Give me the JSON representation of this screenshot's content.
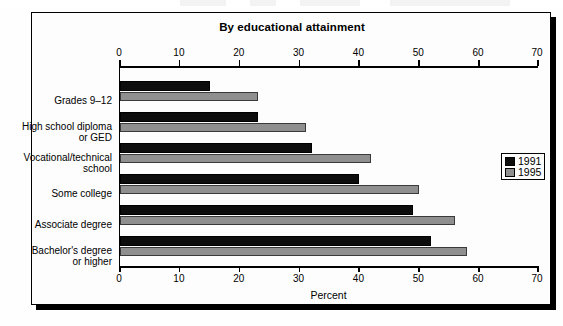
{
  "chart_data": {
    "type": "bar",
    "orientation": "horizontal",
    "title": "By educational attainment",
    "xlabel": "Percent",
    "ylabel": "",
    "xlim": [
      0,
      70
    ],
    "xticks": [
      0,
      10,
      20,
      30,
      40,
      50,
      60,
      70
    ],
    "grid": false,
    "legend_position": "right-middle",
    "categories": [
      "Grades 9–12",
      "High school diploma or GED",
      "Vocational/technical school",
      "Some college",
      "Associate degree",
      "Bachelor's degree or higher"
    ],
    "category_lines": [
      [
        "Grades 9–12"
      ],
      [
        "High school diploma",
        "or GED"
      ],
      [
        "Vocational/technical",
        "school"
      ],
      [
        "Some college"
      ],
      [
        "Associate degree"
      ],
      [
        "Bachelor's degree",
        "or higher"
      ]
    ],
    "series": [
      {
        "name": "1991",
        "color": "#0d0d0d",
        "values": [
          15,
          23,
          32,
          40,
          49,
          52
        ]
      },
      {
        "name": "1995",
        "color": "#8f8f8f",
        "values": [
          23,
          31,
          42,
          50,
          56,
          58
        ]
      }
    ]
  },
  "legend": {
    "items": [
      {
        "label": "1991",
        "color": "#0d0d0d"
      },
      {
        "label": "1995",
        "color": "#8f8f8f"
      }
    ]
  },
  "axis": {
    "tick_labels": [
      "0",
      "10",
      "20",
      "30",
      "40",
      "50",
      "60",
      "70"
    ],
    "bottom_title": "Percent"
  },
  "colors": {
    "bar_1991": "#0d0d0d",
    "bar_1995": "#8f8f8f",
    "frame": "#000000",
    "background": "#fdfdfd"
  }
}
